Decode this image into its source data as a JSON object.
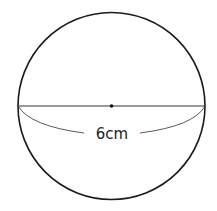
{
  "diagram": {
    "shape": "circle",
    "center": {
      "x": 111.5,
      "y": 106
    },
    "radius": 93.5,
    "stroke_color": "#1a1a1a",
    "diameter_label": "6cm",
    "label_number": "6",
    "label_unit": "cm"
  }
}
